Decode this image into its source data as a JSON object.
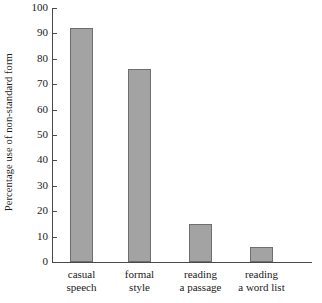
{
  "chart_data": {
    "type": "bar",
    "title": "",
    "xlabel": "",
    "ylabel": "Percentage use of non-standard form",
    "categories": [
      "casual speech",
      "formal style",
      "reading a passage",
      "reading a word list"
    ],
    "category_lines": [
      [
        "casual",
        "speech"
      ],
      [
        "formal",
        "style"
      ],
      [
        "reading",
        "a passage"
      ],
      [
        "reading",
        "a word list"
      ]
    ],
    "values": [
      92,
      76,
      15,
      6
    ],
    "ylim": [
      0,
      100
    ],
    "ytick_labels": [
      "0",
      "10",
      "20",
      "30",
      "40",
      "50",
      "60",
      "70",
      "80",
      "90",
      "100"
    ],
    "ytick_values": [
      0,
      10,
      20,
      30,
      40,
      50,
      60,
      70,
      80,
      90,
      100
    ],
    "grid": false,
    "legend": "none",
    "colors": {
      "bar_fill": "#a3a3a3",
      "bar_stroke": "#6e6e6e",
      "axis": "#4a4a4a",
      "text": "#1a1a1a",
      "background": "#ffffff"
    }
  }
}
